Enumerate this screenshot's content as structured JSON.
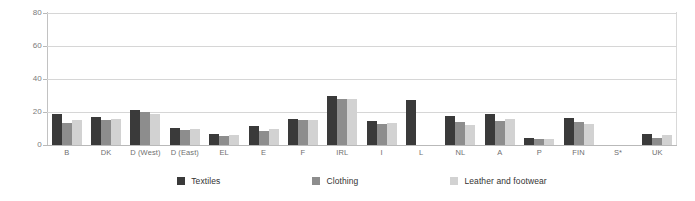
{
  "chart_data": {
    "type": "bar",
    "title": "",
    "xlabel": "",
    "ylabel": "",
    "ylim": [
      0,
      80
    ],
    "yticks": [
      0,
      20,
      40,
      60,
      80
    ],
    "grid": true,
    "legend_position": "bottom",
    "categories": [
      "B",
      "DK",
      "D (West)",
      "D (East)",
      "EL",
      "E",
      "F",
      "IRL",
      "I",
      "L",
      "NL",
      "A",
      "P",
      "FIN",
      "S*",
      "UK"
    ],
    "series": [
      {
        "name": "Textiles",
        "color": "#3a3a3a",
        "values": [
          18.5,
          17.0,
          21.0,
          10.5,
          6.5,
          11.5,
          16.0,
          30.0,
          14.5,
          27.0,
          17.5,
          19.0,
          4.5,
          16.5,
          null,
          6.5
        ]
      },
      {
        "name": "Clothing",
        "color": "#8d8d8d",
        "values": [
          13.5,
          15.0,
          20.0,
          9.0,
          5.5,
          8.5,
          15.0,
          28.0,
          13.0,
          null,
          14.0,
          14.5,
          3.5,
          14.0,
          null,
          4.5
        ]
      },
      {
        "name": "Leather and footwear",
        "color": "#d2d2d2",
        "values": [
          15.0,
          15.5,
          19.0,
          9.5,
          6.0,
          9.5,
          15.0,
          28.0,
          13.5,
          null,
          12.0,
          15.5,
          3.5,
          12.5,
          null,
          6.0
        ]
      }
    ]
  },
  "legend": {
    "items": [
      {
        "label": "Textiles"
      },
      {
        "label": "Clothing"
      },
      {
        "label": "Leather and footwear"
      }
    ]
  },
  "yaxis": {
    "ticks": [
      "80",
      "60",
      "40",
      "20",
      "0"
    ]
  }
}
